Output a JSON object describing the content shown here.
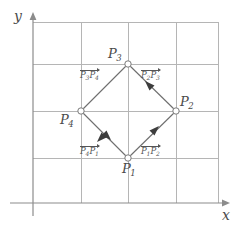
{
  "figure": {
    "type": "geometry-diagram"
  },
  "axes": {
    "x_label": "x",
    "y_label": "y",
    "x_axis_name": "x-axis",
    "y_axis_name": "y-axis",
    "arrow_x": "arrow-right",
    "arrow_y": "arrow-up"
  },
  "grid": {
    "visible": true,
    "color": "#b5b5b5",
    "vertical_lines": 5,
    "horizontal_lines": 4,
    "spacing_px": 47
  },
  "colors": {
    "grid": "#b5b5b5",
    "axis": "#8c8c8c",
    "shape_edge": "#6e6e6e",
    "vertex_stroke": "#7a7a7a",
    "vertex_fill": "#ffffff",
    "label_text": "#4a4a4a",
    "vector_text": "#555555",
    "background": "#ffffff"
  },
  "points": [
    {
      "id": "P1",
      "label": "P",
      "sub": "1",
      "x": 128,
      "y": 158,
      "label_pos": "below"
    },
    {
      "id": "P2",
      "label": "P",
      "sub": "2",
      "x": 176,
      "y": 111,
      "label_pos": "above-right"
    },
    {
      "id": "P3",
      "label": "P",
      "sub": "3",
      "x": 128,
      "y": 64,
      "label_pos": "above-left"
    },
    {
      "id": "P4",
      "label": "P",
      "sub": "4",
      "x": 81,
      "y": 111,
      "label_pos": "below-left"
    }
  ],
  "vectors": [
    {
      "id": "v_P1P2",
      "from": "P1",
      "to": "P2",
      "label_from": "P",
      "sub_from": "1",
      "label_to": "P",
      "sub_to": "2",
      "direction": "up-right"
    },
    {
      "id": "v_P2P3",
      "from": "P2",
      "to": "P3",
      "label_from": "P",
      "sub_from": "2",
      "label_to": "P",
      "sub_to": "3",
      "direction": "up-left"
    },
    {
      "id": "v_P3P4",
      "from": "P3",
      "to": "P4",
      "label_from": "P",
      "sub_from": "3",
      "label_to": "P",
      "sub_to": "4",
      "direction": "down-left"
    },
    {
      "id": "v_P4P1",
      "from": "P4",
      "to": "P1",
      "label_from": "P",
      "sub_from": "4",
      "label_to": "P",
      "sub_to": "1",
      "direction": "down-right"
    }
  ]
}
